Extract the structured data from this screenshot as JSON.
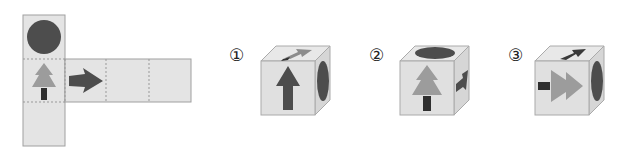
{
  "puzzle": {
    "type": "cube-net-folding",
    "net": {
      "faces": [
        {
          "position": "top-of-column",
          "symbol": "circle",
          "color": "#4a4a4a"
        },
        {
          "position": "middle-of-column",
          "symbol": "tree",
          "tree_color": "#9a9a9a",
          "trunk_color": "#2e2e2e"
        },
        {
          "position": "bottom-of-column",
          "symbol": "blank"
        },
        {
          "position": "strip-1",
          "symbol": "arrow-right",
          "color": "#4a4a4a"
        },
        {
          "position": "strip-2",
          "symbol": "blank"
        },
        {
          "position": "strip-3",
          "symbol": "blank"
        }
      ],
      "face_color": "#e4e4e4",
      "border_color": "#9a9a9a"
    },
    "options": [
      {
        "label": "①",
        "front": "arrow-up",
        "right": "circle",
        "top": "arrow"
      },
      {
        "label": "②",
        "front": "tree",
        "right": "arrow-right",
        "top": "circle"
      },
      {
        "label": "③",
        "front": "tree-sideways",
        "right": "circle",
        "top": "arrow"
      }
    ]
  }
}
